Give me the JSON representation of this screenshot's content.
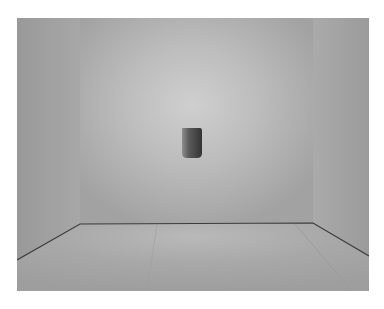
{
  "image": {
    "subject": "empty gallery room with a small dark wall niche",
    "colors": {
      "back_wall_light": "#c9c9c9",
      "back_wall_edge": "#a3a3a3",
      "side_wall": "#9c9c9c",
      "floor": "#a9a9a9",
      "floor_line": "#3c3c3c",
      "niche_dark": "#3a3a3a",
      "niche_light": "#8a8a8a",
      "page_background": "#ffffff"
    }
  }
}
